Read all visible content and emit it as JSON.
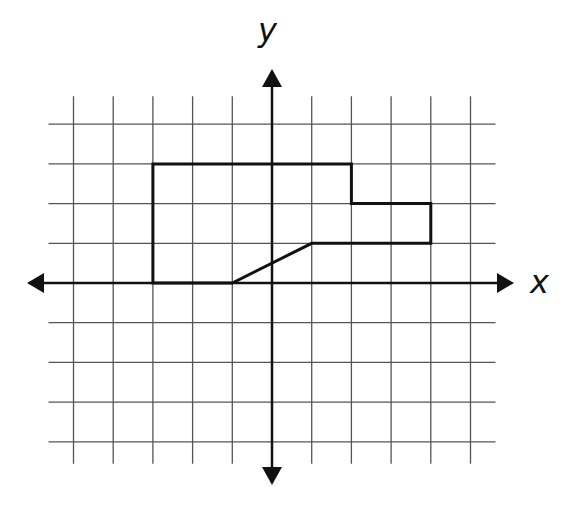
{
  "diagram": {
    "type": "coordinate-grid-figure",
    "axes": {
      "x_label": "x",
      "y_label": "y",
      "x_range": [
        -5,
        5
      ],
      "y_range": [
        -4,
        4
      ],
      "arrows": true
    },
    "grid": {
      "unit_px": 39.7,
      "origin_px": [
        272,
        283
      ],
      "x_lines": [
        -5,
        -4,
        -3,
        -2,
        -1,
        0,
        1,
        2,
        3,
        4,
        5
      ],
      "y_lines": [
        4,
        3,
        2,
        1,
        0,
        -1,
        -2,
        -3,
        -4
      ]
    },
    "shape": {
      "name": "polygon",
      "vertices": [
        [
          -3,
          0
        ],
        [
          -3,
          3
        ],
        [
          2,
          3
        ],
        [
          2,
          2
        ],
        [
          4,
          2
        ],
        [
          4,
          1
        ],
        [
          1,
          1
        ],
        [
          -1,
          0
        ]
      ]
    },
    "colors": {
      "grid": "#555555",
      "axis": "#111111",
      "shape": "#111111",
      "background": "#ffffff"
    }
  }
}
